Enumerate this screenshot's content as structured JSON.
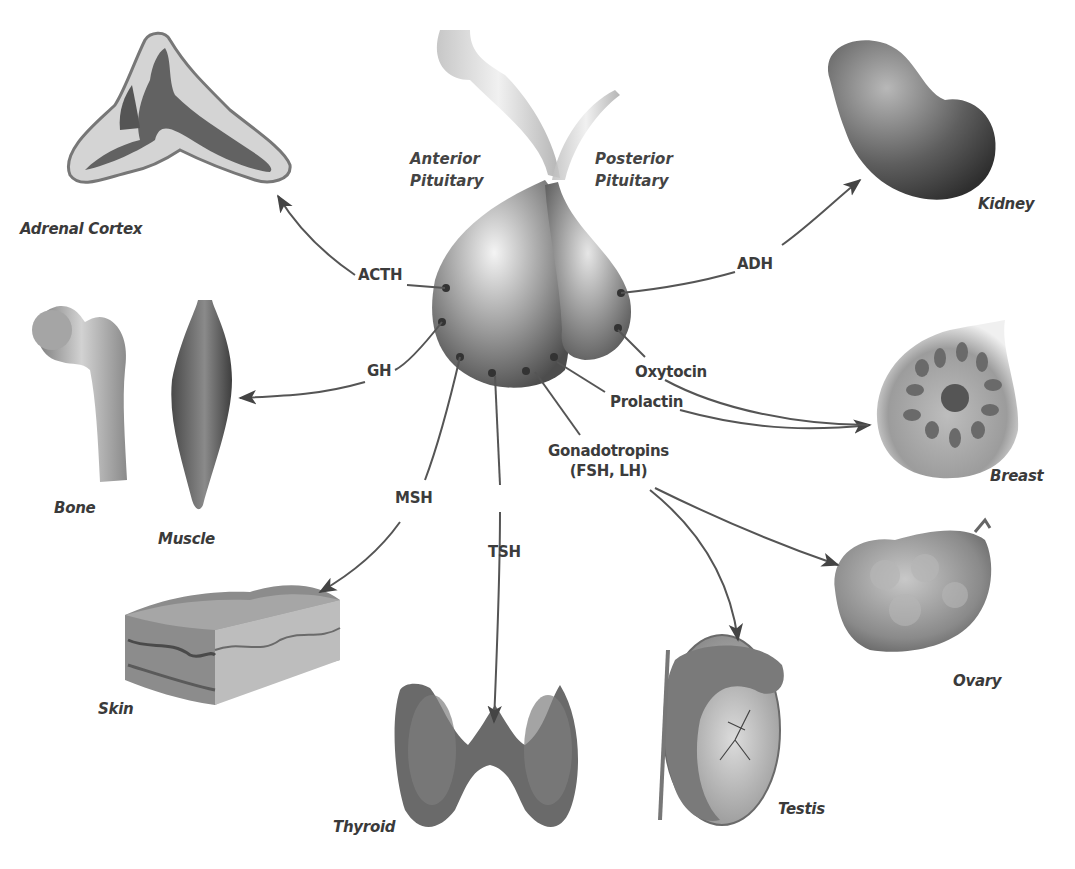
{
  "diagram": {
    "center": {
      "anterior": "Anterior\nPituitary",
      "anterior_line1": "Anterior",
      "anterior_line2": "Pituitary",
      "posterior_line1": "Posterior",
      "posterior_line2": "Pituitary"
    },
    "hormones": {
      "acth": "ACTH",
      "gh": "GH",
      "msh": "MSH",
      "tsh": "TSH",
      "adh": "ADH",
      "oxytocin": "Oxytocin",
      "prolactin": "Prolactin",
      "gonadotropins_line1": "Gonadotropins",
      "gonadotropins_line2": "(FSH, LH)"
    },
    "organs": {
      "adrenal_cortex": "Adrenal Cortex",
      "bone": "Bone",
      "muscle": "Muscle",
      "skin": "Skin",
      "thyroid": "Thyroid",
      "testis": "Testis",
      "ovary": "Ovary",
      "breast": "Breast",
      "kidney": "Kidney"
    },
    "colors": {
      "background": "#ffffff",
      "line": "#555555",
      "text": "#3a3a3a"
    }
  }
}
